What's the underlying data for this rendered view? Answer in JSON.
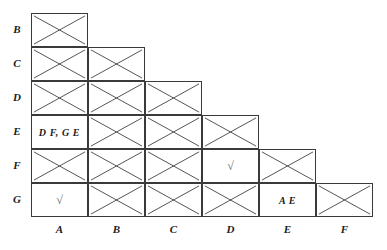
{
  "chart_data": {
    "type": "table",
    "title": "",
    "row_labels": [
      "B",
      "C",
      "D",
      "E",
      "F",
      "G"
    ],
    "column_labels": [
      "A",
      "B",
      "C",
      "D",
      "E",
      "F"
    ],
    "grid": {
      "left": 31,
      "top": 13,
      "cell_width": 57,
      "cell_height": 34,
      "columns": 6,
      "rows": 6
    },
    "cells": [
      {
        "row": "B",
        "col": "A",
        "value": "",
        "crossed": true
      },
      {
        "row": "C",
        "col": "A",
        "value": "",
        "crossed": true
      },
      {
        "row": "C",
        "col": "B",
        "value": "",
        "crossed": true
      },
      {
        "row": "D",
        "col": "A",
        "value": "",
        "crossed": true
      },
      {
        "row": "D",
        "col": "B",
        "value": "",
        "crossed": true
      },
      {
        "row": "D",
        "col": "C",
        "value": "",
        "crossed": true
      },
      {
        "row": "E",
        "col": "A",
        "value": "D F, G E",
        "crossed": false
      },
      {
        "row": "E",
        "col": "B",
        "value": "",
        "crossed": true
      },
      {
        "row": "E",
        "col": "C",
        "value": "",
        "crossed": true
      },
      {
        "row": "E",
        "col": "D",
        "value": "",
        "crossed": true
      },
      {
        "row": "F",
        "col": "A",
        "value": "",
        "crossed": true
      },
      {
        "row": "F",
        "col": "B",
        "value": "",
        "crossed": true
      },
      {
        "row": "F",
        "col": "C",
        "value": "",
        "crossed": true
      },
      {
        "row": "F",
        "col": "D",
        "value": "√",
        "crossed": false
      },
      {
        "row": "F",
        "col": "E",
        "value": "",
        "crossed": true
      },
      {
        "row": "G",
        "col": "A",
        "value": "√",
        "crossed": false
      },
      {
        "row": "G",
        "col": "B",
        "value": "",
        "crossed": true
      },
      {
        "row": "G",
        "col": "C",
        "value": "",
        "crossed": true
      },
      {
        "row": "G",
        "col": "D",
        "value": "",
        "crossed": true
      },
      {
        "row": "G",
        "col": "E",
        "value": "A E",
        "crossed": false
      },
      {
        "row": "G",
        "col": "F",
        "value": "",
        "crossed": true
      }
    ],
    "colors": {
      "background": "#ffffff",
      "cell_border": "#3a3a3a",
      "cross_stroke": "#555555",
      "label_text": "#1b1b1b",
      "tick_text": "#6a6a6a"
    }
  }
}
